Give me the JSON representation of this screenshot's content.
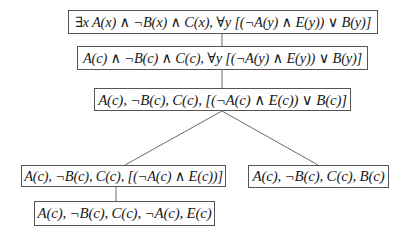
{
  "diagram": {
    "type": "tableau-tree",
    "nodes": [
      {
        "id": "n1",
        "label": "∃x A(x) ∧ ¬B(x) ∧ C(x), ∀y [(¬A(y) ∧ E(y)) ∨ B(y)]"
      },
      {
        "id": "n2",
        "label": "A(c) ∧ ¬B(c) ∧ C(c), ∀y [(¬A(y) ∧ E(y)) ∨ B(y)]"
      },
      {
        "id": "n3",
        "label": "A(c), ¬B(c), C(c), [(¬A(c) ∧ E(c)) ∨ B(c)]"
      },
      {
        "id": "n4",
        "label": "A(c), ¬B(c), C(c), [(¬A(c) ∧ E(c))]"
      },
      {
        "id": "n5",
        "label": "A(c), ¬B(c), C(c), B(c)"
      },
      {
        "id": "n6",
        "label": "A(c), ¬B(c), C(c), ¬A(c), E(c)"
      }
    ],
    "edges": [
      {
        "from": "n1",
        "to": "n2"
      },
      {
        "from": "n2",
        "to": "n3"
      },
      {
        "from": "n3",
        "to": "n4"
      },
      {
        "from": "n3",
        "to": "n5"
      },
      {
        "from": "n4",
        "to": "n6"
      }
    ]
  }
}
